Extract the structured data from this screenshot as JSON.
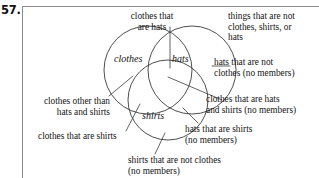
{
  "problem": {
    "number": "57."
  },
  "diagram": {
    "type": "venn-three-set",
    "set_labels": {
      "clothes": "clothes",
      "hats": "hats",
      "shirts": "shirts"
    },
    "circles": [
      {
        "name": "clothes",
        "cx": 148,
        "cy": 70,
        "r": 44
      },
      {
        "name": "hats",
        "cx": 192,
        "cy": 70,
        "r": 44
      },
      {
        "name": "shirts",
        "cx": 168,
        "cy": 100,
        "r": 40
      }
    ],
    "callouts": {
      "clothes_that_are_hats": "clothes that\nare hats",
      "things_that_are_not": "things that are not\nclothes, shirts, or\nhats",
      "hats_that_are_not_clothes": "hats that are not\nclothes (no members)",
      "clothes_that_are_hats_and_shirts": "clothes that are hats\nand shirts (no members)",
      "hats_that_are_shirts": "hats that are shirts\n(no members)",
      "clothes_other_than_hats_and_shirts": "clothes other than\nhats and shirts",
      "clothes_that_are_shirts": "clothes that are shirts",
      "shirts_that_are_not_clothes": "shirts that are not clothes\n(no members)"
    },
    "colors": {
      "stroke": "#3a3a3a",
      "frame": "#8a8a8a",
      "text": "#141414",
      "background": "#ffffff"
    }
  }
}
